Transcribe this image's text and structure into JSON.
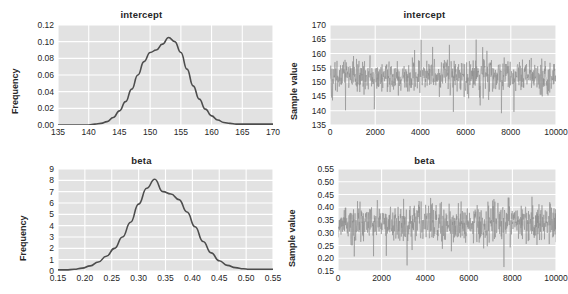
{
  "figure": {
    "background": "#ffffff",
    "panel_background": "#e2e2e2",
    "gridline_color": "#ffffff",
    "line_color": "#4d4d4d",
    "trace_color": "#8c8c8c"
  },
  "panels": [
    {
      "key": "intercept_density",
      "title": "intercept",
      "ylabel": "Frequency",
      "position": "top-left"
    },
    {
      "key": "intercept_trace",
      "title": "intercept",
      "ylabel": "Sample value",
      "position": "top-right"
    },
    {
      "key": "beta_density",
      "title": "beta",
      "ylabel": "Frequency",
      "position": "bottom-left"
    },
    {
      "key": "beta_trace",
      "title": "beta",
      "ylabel": "Sample value",
      "position": "bottom-right"
    }
  ],
  "chart_data": [
    {
      "type": "line",
      "key": "intercept_density",
      "title": "intercept",
      "xlabel": "",
      "ylabel": "Frequency",
      "xlim": [
        135,
        170
      ],
      "ylim": [
        0.0,
        0.12
      ],
      "xticks": [
        135,
        140,
        145,
        150,
        155,
        160,
        165,
        170
      ],
      "xtick_labels": [
        "135",
        "140",
        "145",
        "150",
        "155",
        "160",
        "165",
        "170"
      ],
      "yticks": [
        0.0,
        0.02,
        0.04,
        0.06,
        0.08,
        0.1,
        0.12
      ],
      "ytick_labels": [
        "0.00",
        "0.02",
        "0.04",
        "0.06",
        "0.08",
        "0.10",
        "0.12"
      ],
      "grid": true,
      "legend": "none",
      "x": [
        140.0,
        141.0,
        142.0,
        143.0,
        144.0,
        145.0,
        146.0,
        147.0,
        148.0,
        149.0,
        150.0,
        151.0,
        152.0,
        153.0,
        154.0,
        155.0,
        156.0,
        157.0,
        158.0,
        159.0,
        160.0,
        161.0,
        162.0,
        163.0,
        164.0,
        165.0,
        166.0
      ],
      "values": [
        0.0,
        0.001,
        0.002,
        0.004,
        0.009,
        0.017,
        0.028,
        0.043,
        0.06,
        0.076,
        0.087,
        0.09,
        0.097,
        0.105,
        0.1,
        0.087,
        0.067,
        0.047,
        0.031,
        0.019,
        0.011,
        0.006,
        0.003,
        0.002,
        0.001,
        0.001,
        0.001
      ]
    },
    {
      "type": "line",
      "key": "intercept_trace",
      "title": "intercept",
      "xlabel": "",
      "ylabel": "Sample value",
      "xlim": [
        0,
        10000
      ],
      "ylim": [
        135,
        170
      ],
      "xticks": [
        0,
        2000,
        4000,
        6000,
        8000,
        10000
      ],
      "xtick_labels": [
        "0",
        "2000",
        "4000",
        "6000",
        "8000",
        "10000"
      ],
      "yticks": [
        135,
        140,
        145,
        150,
        155,
        160,
        165,
        170
      ],
      "ytick_labels": [
        "135",
        "140",
        "145",
        "150",
        "155",
        "160",
        "165",
        "170"
      ],
      "grid": true,
      "legend": "none",
      "series_description": "MCMC trace of 10000 samples, mean approximately 152, range approximately 139 to 166",
      "trace_mean": 152,
      "trace_min": 139,
      "trace_max": 166,
      "n_samples": 10000
    },
    {
      "type": "line",
      "key": "beta_density",
      "title": "beta",
      "xlabel": "",
      "ylabel": "Frequency",
      "xlim": [
        0.15,
        0.55
      ],
      "ylim": [
        0,
        9
      ],
      "xticks": [
        0.15,
        0.2,
        0.25,
        0.3,
        0.35,
        0.4,
        0.45,
        0.5,
        0.55
      ],
      "xtick_labels": [
        "0.15",
        "0.20",
        "0.25",
        "0.30",
        "0.35",
        "0.40",
        "0.45",
        "0.50",
        "0.55"
      ],
      "yticks": [
        0,
        1,
        2,
        3,
        4,
        5,
        6,
        7,
        8,
        9
      ],
      "ytick_labels": [
        "0",
        "1",
        "2",
        "3",
        "4",
        "5",
        "6",
        "7",
        "8",
        "9"
      ],
      "grid": true,
      "legend": "none",
      "x": [
        0.165,
        0.18,
        0.195,
        0.21,
        0.225,
        0.24,
        0.255,
        0.27,
        0.285,
        0.3,
        0.315,
        0.33,
        0.345,
        0.36,
        0.375,
        0.39,
        0.405,
        0.42,
        0.435,
        0.45,
        0.465,
        0.48,
        0.495,
        0.505
      ],
      "values": [
        0.1,
        0.15,
        0.25,
        0.45,
        0.8,
        1.3,
        2.0,
        3.0,
        4.3,
        5.9,
        7.3,
        8.1,
        7.0,
        6.8,
        6.3,
        5.2,
        3.9,
        2.6,
        1.6,
        0.9,
        0.5,
        0.3,
        0.2,
        0.15
      ]
    },
    {
      "type": "line",
      "key": "beta_trace",
      "title": "beta",
      "xlabel": "",
      "ylabel": "Sample value",
      "xlim": [
        0,
        10000
      ],
      "ylim": [
        0.15,
        0.55
      ],
      "xticks": [
        0,
        2000,
        4000,
        6000,
        8000,
        10000
      ],
      "xtick_labels": [
        "0",
        "2000",
        "4000",
        "6000",
        "8000",
        "10000"
      ],
      "yticks": [
        0.15,
        0.2,
        0.25,
        0.3,
        0.35,
        0.4,
        0.45,
        0.5,
        0.55
      ],
      "ytick_labels": [
        "0.15",
        "0.20",
        "0.25",
        "0.30",
        "0.35",
        "0.40",
        "0.45",
        "0.50",
        "0.55"
      ],
      "grid": true,
      "legend": "none",
      "series_description": "MCMC trace of 10000 samples, mean approximately 0.34, range approximately 0.165 to 0.515",
      "trace_mean": 0.34,
      "trace_min": 0.165,
      "trace_max": 0.515,
      "n_samples": 10000
    }
  ]
}
